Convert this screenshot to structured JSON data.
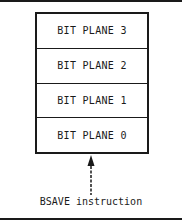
{
  "diagram": {
    "planes": [
      {
        "label": "BIT PLANE 3"
      },
      {
        "label": "BIT PLANE 2"
      },
      {
        "label": "BIT PLANE 1"
      },
      {
        "label": "BIT PLANE 0"
      }
    ],
    "caption": "BSAVE instruction",
    "arrow_icon": "dashed-up-arrow-icon",
    "colors": {
      "ink": "#1a1a1a",
      "background": "#ffffff"
    }
  }
}
